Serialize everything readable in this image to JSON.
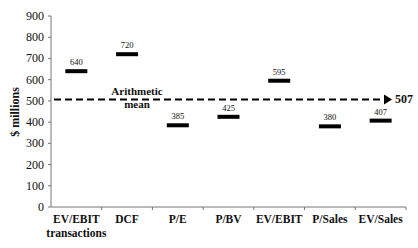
{
  "chart_data": {
    "type": "scatter",
    "marker": "horizontal-bar",
    "title": "",
    "xlabel": "",
    "ylabel": "$ millions",
    "ylim": [
      0,
      900
    ],
    "yticks": [
      0,
      100,
      200,
      300,
      400,
      500,
      600,
      700,
      800,
      900
    ],
    "grid": false,
    "legend": null,
    "categories": [
      [
        "EV/EBIT",
        "transactions"
      ],
      [
        "DCF"
      ],
      [
        "P/E"
      ],
      [
        "P/BV"
      ],
      [
        "EV/EBIT"
      ],
      [
        "P/Sales"
      ],
      [
        "EV/Sales"
      ]
    ],
    "values": [
      640,
      720,
      385,
      425,
      595,
      380,
      407
    ],
    "value_labels": [
      "640",
      "720",
      "385",
      "425",
      "595",
      "380",
      "407"
    ],
    "reference_line": {
      "label": [
        "Arithmetic",
        "mean"
      ],
      "value": 507,
      "value_label": "507",
      "style": "dashed-arrow"
    }
  }
}
